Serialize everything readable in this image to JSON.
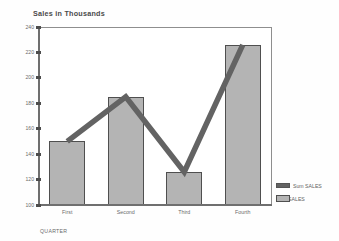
{
  "chart_data": {
    "type": "bar",
    "title": "Sales in Thousands",
    "xlabel": "QUARTER",
    "ylabel": "",
    "categories": [
      "First",
      "Second",
      "Third",
      "Fourth"
    ],
    "ylim": [
      100,
      240
    ],
    "yticks": [
      100,
      120,
      140,
      160,
      180,
      200,
      220,
      240
    ],
    "ytick_labels": [
      "100",
      "120",
      "140",
      "160",
      "180",
      "200",
      "220",
      "240"
    ],
    "grid": false,
    "legend_position": "right-bottom",
    "series": [
      {
        "name": "Sum SALES",
        "render": "bar",
        "color": "#b4b4b4",
        "edge_color": "#4f4f4f",
        "values": [
          150,
          185,
          126,
          226
        ]
      },
      {
        "name": "Sum SALES",
        "render": "line",
        "color": "#636363",
        "values": [
          150,
          185,
          126,
          226
        ]
      }
    ]
  },
  "legend": {
    "entries": [
      {
        "label": "Sum SALES",
        "swatch": "line-swatch"
      },
      {
        "label": "Sum SALES",
        "swatch": "bar-swatch"
      }
    ]
  }
}
